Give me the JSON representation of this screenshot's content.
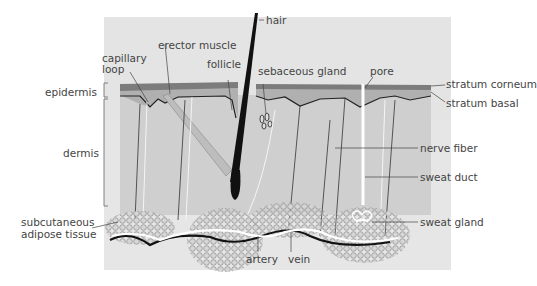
{
  "diagram": {
    "type": "skin cross-section",
    "labels": {
      "hair": "hair",
      "erector_muscle": "erector muscle",
      "capillary_loop_1": "capillary",
      "capillary_loop_2": "loop",
      "follicle": "follicle",
      "sebaceous_gland": "sebaceous gland",
      "pore": "pore",
      "stratum_corneum": "stratum corneum",
      "stratum_basal": "stratum basal",
      "epidermis": "epidermis",
      "dermis": "dermis",
      "nerve_fiber": "nerve fiber",
      "sweat_duct": "sweat duct",
      "subcutaneous_1": "subcutaneous",
      "subcutaneous_2": "adipose tissue",
      "sweat_gland": "sweat gland",
      "artery": "artery",
      "vein": "vein"
    },
    "colors": {
      "background_panel": "#e2e2e2",
      "dermis": "#cfcfcf",
      "epidermis": "#b4b4b4",
      "stratum_corneum": "#7a7a7a",
      "hair": "#111111",
      "fat_cell": "#9a9a9a",
      "text": "#444444"
    }
  }
}
